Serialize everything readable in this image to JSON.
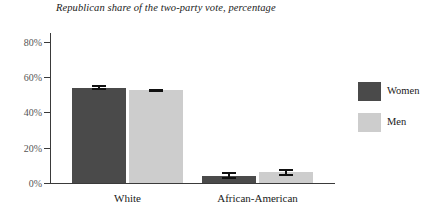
{
  "chart_data": {
    "type": "bar",
    "title": "Republican share of the two-party vote, percentage",
    "xlabel": "",
    "ylabel": "",
    "ylim": [
      0,
      85
    ],
    "yticks": [
      0,
      20,
      40,
      60,
      80
    ],
    "ytick_labels": [
      "0%",
      "20%",
      "40%",
      "60%",
      "80%"
    ],
    "grid": false,
    "legend_position": "right",
    "categories": [
      "White",
      "African-American"
    ],
    "series": [
      {
        "name": "Women",
        "color": "#4a4a4a",
        "values": [
          54,
          4
        ],
        "errors": [
          1.5,
          2
        ]
      },
      {
        "name": "Men",
        "color": "#cdcdcd",
        "values": [
          52.5,
          6
        ],
        "errors": [
          1,
          2
        ]
      }
    ]
  },
  "legend": {
    "items": [
      {
        "label": "Women",
        "color": "#4a4a4a"
      },
      {
        "label": "Men",
        "color": "#cdcdcd"
      }
    ]
  }
}
